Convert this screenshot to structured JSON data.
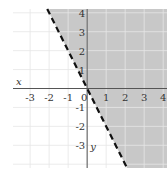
{
  "chart_data": {
    "type": "line",
    "title": "",
    "boundary": {
      "slope": -2,
      "intercept": 0,
      "style": "dashed"
    },
    "inequality": "y > -2x",
    "shaded_side": "right",
    "xlabel": "x",
    "ylabel": "y",
    "xlim": [
      -3.9,
      4.2
    ],
    "ylim": [
      -4.2,
      4.2
    ],
    "xticks": [
      -3,
      -2,
      -1,
      0,
      1,
      2,
      3,
      4
    ],
    "yticks": [
      -3,
      -2,
      -1,
      1,
      2,
      3,
      4
    ],
    "xtick_labels": [
      "-3",
      "-2",
      "-1",
      "0",
      "1",
      "2",
      "3",
      "4"
    ],
    "ytick_labels": [
      "-3",
      "-2",
      "-1",
      "1",
      "2",
      "3",
      "4"
    ],
    "grid": true,
    "colors": {
      "shade": "#c8c8c8",
      "grid": "#e6e6e6",
      "axis": "#555555",
      "line": "#111111"
    }
  }
}
